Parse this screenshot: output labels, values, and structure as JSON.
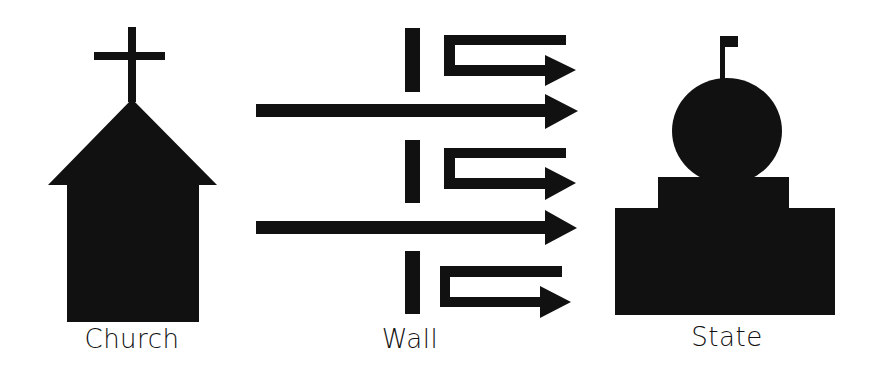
{
  "diagram": {
    "labels": {
      "church": "Church",
      "wall": "Wall",
      "state": "State"
    },
    "colors": {
      "shape": "#111111",
      "background": "#ffffff"
    },
    "elements": [
      {
        "name": "church",
        "icon": "church-icon",
        "label": "Church"
      },
      {
        "name": "wall",
        "icon": "wall-segments",
        "segments": 3,
        "label": "Wall"
      },
      {
        "name": "state",
        "icon": "capitol-building-icon",
        "label": "State"
      }
    ],
    "arrows": {
      "through": 2,
      "deflected": 3
    }
  }
}
